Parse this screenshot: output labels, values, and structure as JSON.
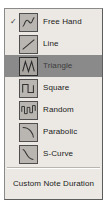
{
  "menu": {
    "title": "Shape Menu",
    "background_color": "#ece9e4",
    "border_color": "#8a8a8a",
    "highlight_color": "#8a8a8a",
    "icon_fill_color": "#b9b6b1",
    "icon_stroke_color": "#333333",
    "check_glyph": "✓",
    "items": [
      {
        "label": "Free Hand",
        "icon": "freehand-curve-icon",
        "checked": true,
        "selected": false
      },
      {
        "label": "Line",
        "icon": "diagonal-line-icon",
        "checked": false,
        "selected": false
      },
      {
        "label": "Triangle",
        "icon": "triangle-wave-icon",
        "checked": false,
        "selected": true
      },
      {
        "label": "Square",
        "icon": "square-wave-icon",
        "checked": false,
        "selected": false
      },
      {
        "label": "Random",
        "icon": "random-wave-icon",
        "checked": false,
        "selected": false
      },
      {
        "label": "Parabolic",
        "icon": "parabolic-curve-icon",
        "checked": false,
        "selected": false
      },
      {
        "label": "S-Curve",
        "icon": "s-curve-icon",
        "checked": false,
        "selected": false
      }
    ],
    "footer": {
      "label": "Custom Note Duration"
    }
  }
}
